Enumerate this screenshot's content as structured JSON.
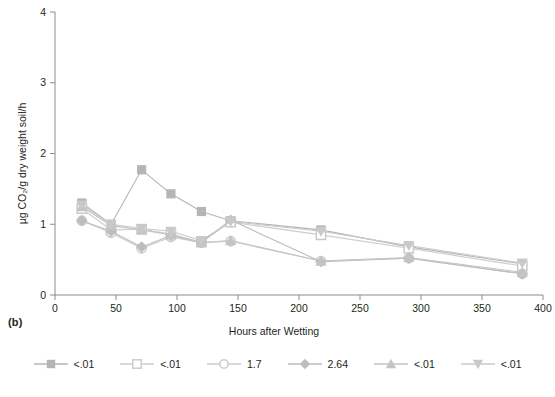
{
  "panel": {
    "label": "(b)"
  },
  "chart_data": {
    "type": "line",
    "title": "",
    "xlabel": "Hours after Wetting",
    "ylabel": "µg CO₂/g dry weight soil/h",
    "xlim": [
      0,
      400
    ],
    "ylim": [
      0,
      4
    ],
    "xticks": [
      0,
      50,
      100,
      150,
      200,
      250,
      300,
      350,
      400
    ],
    "xticklabels": [
      "0",
      "50",
      "100",
      "150",
      "200",
      "250",
      "300",
      "350",
      "400"
    ],
    "yticks": [
      0,
      1,
      2,
      3,
      4
    ],
    "yticklabels": [
      "0",
      "1",
      "2",
      "3",
      "4"
    ],
    "grid": false,
    "legend_position": "bottom",
    "series": [
      {
        "name": "<.01",
        "marker": "filled-square",
        "color": "#b5b5b5",
        "x": [
          22,
          46,
          71,
          95,
          120,
          144,
          218,
          290,
          383
        ],
        "y": [
          1.3,
          1.0,
          1.77,
          1.43,
          1.18,
          1.05,
          0.92,
          0.68,
          0.44
        ]
      },
      {
        "name": "<.01",
        "marker": "open-square",
        "color": "#cccccc",
        "x": [
          22,
          46,
          71,
          95,
          120,
          144,
          218,
          290,
          383
        ],
        "y": [
          1.22,
          0.92,
          0.93,
          0.86,
          0.75,
          1.03,
          0.85,
          0.66,
          0.41
        ]
      },
      {
        "name": "1.7",
        "marker": "open-circle",
        "color": "#cccccc",
        "x": [
          22,
          46,
          71,
          95,
          120,
          144,
          218,
          290,
          383
        ],
        "y": [
          1.05,
          0.88,
          0.66,
          0.82,
          0.74,
          0.76,
          0.48,
          0.52,
          0.3
        ]
      },
      {
        "name": "2.64",
        "marker": "filled-diamond",
        "color": "#bdbdbd",
        "x": [
          22,
          46,
          71,
          95,
          120,
          144,
          218,
          290,
          383
        ],
        "y": [
          1.05,
          0.9,
          0.68,
          0.84,
          0.74,
          1.06,
          0.47,
          0.52,
          0.3
        ]
      },
      {
        "name": "<.01",
        "marker": "filled-triangle-up",
        "color": "#c4c4c4",
        "x": [
          22,
          46,
          71,
          95,
          120,
          144,
          218,
          290,
          383
        ],
        "y": [
          1.25,
          0.98,
          0.92,
          0.85,
          0.74,
          0.77,
          0.48,
          0.53,
          0.32
        ]
      },
      {
        "name": "<.01",
        "marker": "filled-triangle-down",
        "color": "#c9c9c9",
        "x": [
          22,
          46,
          71,
          95,
          120,
          144,
          218,
          290,
          383
        ],
        "y": [
          1.27,
          1.0,
          0.94,
          0.9,
          0.77,
          1.04,
          0.9,
          0.7,
          0.45
        ]
      }
    ]
  },
  "legend": {
    "items": [
      {
        "label": "<.01",
        "marker": "filled-square"
      },
      {
        "label": "<.01",
        "marker": "open-square"
      },
      {
        "label": "1.7",
        "marker": "open-circle"
      },
      {
        "label": "2.64",
        "marker": "filled-diamond"
      },
      {
        "label": "<.01",
        "marker": "filled-triangle-up"
      },
      {
        "label": "<.01",
        "marker": "filled-triangle-down"
      }
    ]
  },
  "colors": {
    "axis": "#8c8c8c",
    "text": "#231f20",
    "series_gray": "#c0c0c0"
  }
}
